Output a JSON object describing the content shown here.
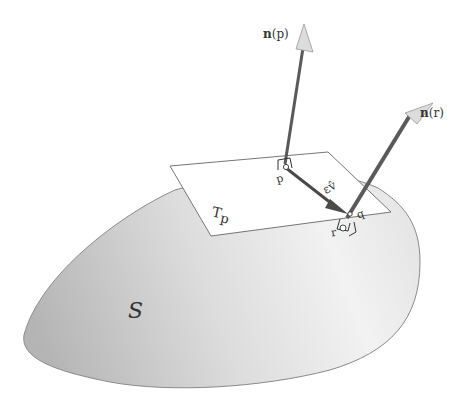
{
  "diagram": {
    "surface_label": "S",
    "tangent_plane_label": "T",
    "tangent_plane_subscript": "p",
    "point_p_label": "p",
    "point_q_label": "q",
    "point_r_label": "r",
    "vector_label": "εv̂",
    "normal_p_label_bold": "n",
    "normal_p_label_rest": "(p)",
    "normal_r_label_bold": "n",
    "normal_r_label_rest": "(r)"
  },
  "colors": {
    "surface_fill_dark": "#b8b8b8",
    "surface_fill_light": "#ececec",
    "surface_stroke": "#8a8a8a",
    "plane_fill": "#ffffff",
    "plane_stroke": "#666666",
    "normal_shaft": "#5a5a5a",
    "arrowhead_fill": "#d8d8d8",
    "vector_color": "#4a4a4a"
  }
}
